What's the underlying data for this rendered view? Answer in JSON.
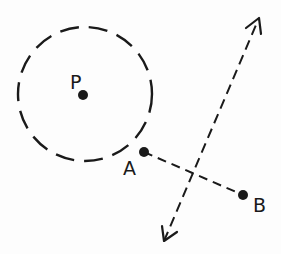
{
  "diagram": {
    "colors": {
      "ink": "#1a1a1a",
      "background": "#fdfdfd"
    },
    "circle": {
      "center_label": "P",
      "cx": 85,
      "cy": 94,
      "r": 67,
      "style": "dashed"
    },
    "points": [
      {
        "id": "P",
        "label": "P",
        "x": 83,
        "y": 95,
        "label_x": 70,
        "label_y": 89
      },
      {
        "id": "A",
        "label": "A",
        "x": 144,
        "y": 152,
        "label_x": 123,
        "label_y": 175
      },
      {
        "id": "B",
        "label": "B",
        "x": 243,
        "y": 195,
        "label_x": 253,
        "label_y": 212
      }
    ],
    "segment": {
      "from": "A",
      "to": "B",
      "style": "dashed"
    },
    "bisector": {
      "x1": 164,
      "y1": 241,
      "x2": 259,
      "y2": 18,
      "style": "dashed",
      "arrows": "both"
    }
  }
}
